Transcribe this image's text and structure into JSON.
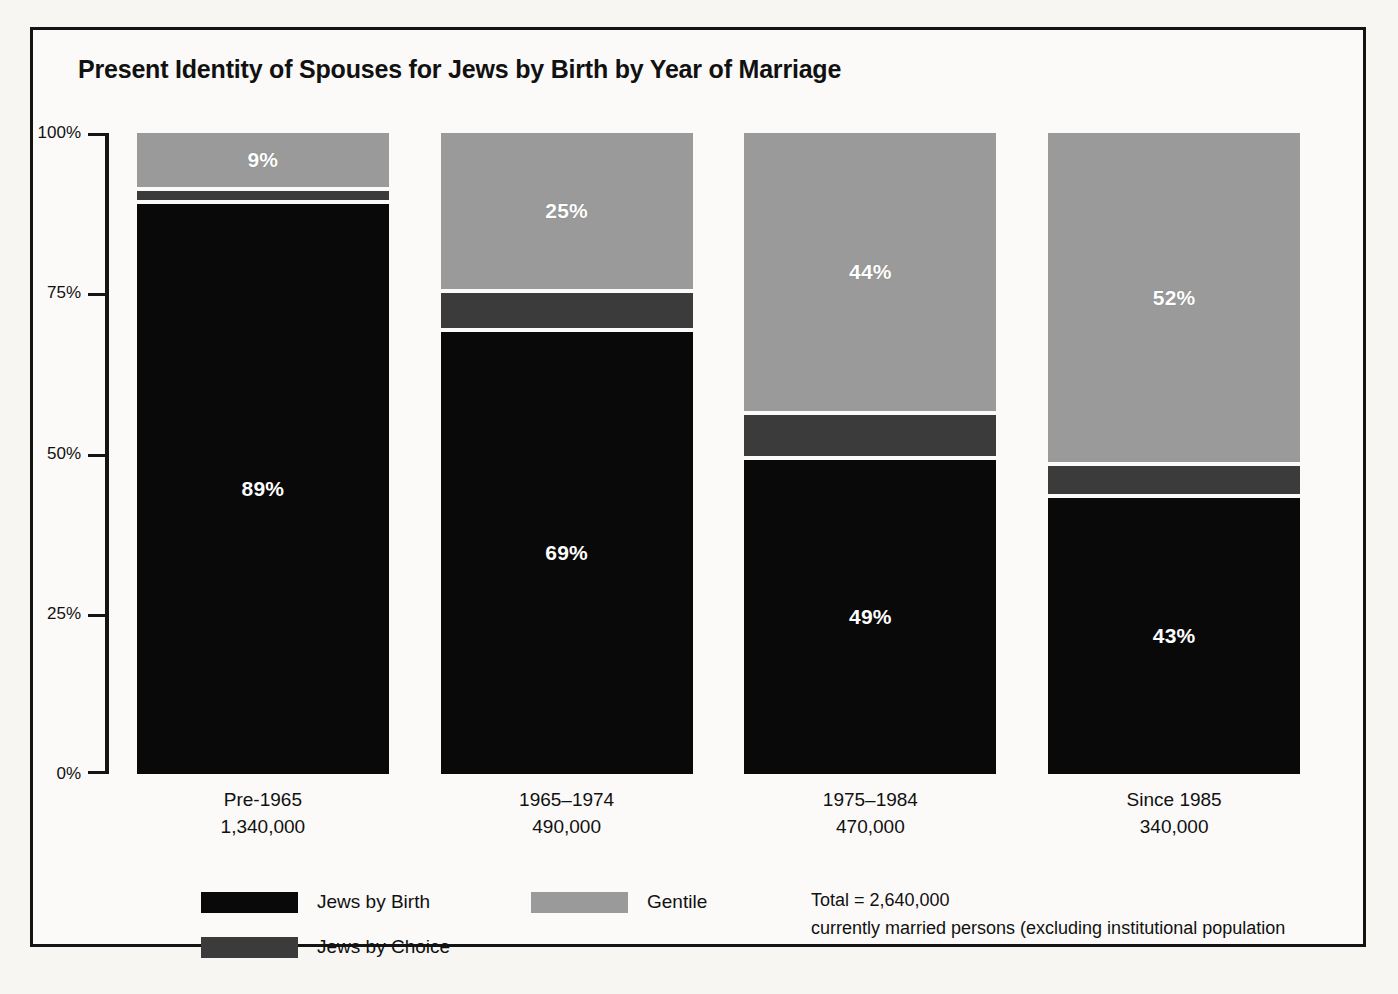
{
  "chart_data": {
    "type": "bar",
    "subtype": "stacked-100-percent",
    "title": "Present Identity of Spouses for Jews by Birth by Year of Marriage",
    "xlabel": "",
    "ylabel": "",
    "ylim": [
      0,
      100
    ],
    "grid": false,
    "legend_position": "bottom-left",
    "categories": [
      "Pre-1965",
      "1965–1974",
      "1975–1984",
      "Since 1985"
    ],
    "category_counts": [
      "1,340,000",
      "490,000",
      "470,000",
      "340,000"
    ],
    "y_ticks": [
      "0%",
      "25%",
      "50%",
      "75%",
      "100%"
    ],
    "y_tick_values": [
      0,
      25,
      50,
      75,
      100
    ],
    "series": [
      {
        "name": "Jews by Birth",
        "color": "#090909",
        "values": [
          89,
          69,
          49,
          43
        ],
        "labels": [
          "89%",
          "69%",
          "49%",
          "43%"
        ]
      },
      {
        "name": "Jews by Choice",
        "color": "#3b3b3b",
        "values": [
          2,
          6,
          7,
          5
        ],
        "labels": [
          "",
          "",
          "",
          ""
        ]
      },
      {
        "name": "Gentile",
        "color": "#9a9a9a",
        "values": [
          9,
          25,
          44,
          52
        ],
        "labels": [
          "9%",
          "25%",
          "44%",
          "52%"
        ]
      }
    ],
    "annotations": [
      "Total = 2,640,000",
      "currently married persons (excluding institutional population"
    ]
  },
  "title": "Present Identity of Spouses for Jews by Birth by Year of Marriage",
  "axis": {
    "y_ticks": [
      {
        "label": "100%",
        "value": 100
      },
      {
        "label": "75%",
        "value": 75
      },
      {
        "label": "50%",
        "value": 50
      },
      {
        "label": "25%",
        "value": 25
      },
      {
        "label": "0%",
        "value": 0
      }
    ]
  },
  "bars": [
    {
      "category": "Pre-1965",
      "count": "1,340,000",
      "segments": [
        {
          "series": "Gentile",
          "value": 9,
          "label": "9%"
        },
        {
          "series": "Jews by Choice",
          "value": 2,
          "label": ""
        },
        {
          "series": "Jews by Birth",
          "value": 89,
          "label": "89%"
        }
      ]
    },
    {
      "category": "1965–1974",
      "count": "490,000",
      "segments": [
        {
          "series": "Gentile",
          "value": 25,
          "label": "25%"
        },
        {
          "series": "Jews by Choice",
          "value": 6,
          "label": ""
        },
        {
          "series": "Jews by Birth",
          "value": 69,
          "label": "69%"
        }
      ]
    },
    {
      "category": "1975–1984",
      "count": "470,000",
      "segments": [
        {
          "series": "Gentile",
          "value": 44,
          "label": "44%"
        },
        {
          "series": "Jews by Choice",
          "value": 7,
          "label": ""
        },
        {
          "series": "Jews by Birth",
          "value": 49,
          "label": "49%"
        }
      ]
    },
    {
      "category": "Since 1985",
      "count": "340,000",
      "segments": [
        {
          "series": "Gentile",
          "value": 52,
          "label": "52%"
        },
        {
          "series": "Jews by Choice",
          "value": 5,
          "label": ""
        },
        {
          "series": "Jews by Birth",
          "value": 43,
          "label": "43%"
        }
      ]
    }
  ],
  "legend": [
    {
      "label": "Jews by Birth",
      "color": "#090909"
    },
    {
      "label": "Jews by Choice",
      "color": "#3b3b3b"
    },
    {
      "label": "Gentile",
      "color": "#9a9a9a"
    }
  ],
  "note": {
    "line1": "Total = 2,640,000",
    "line2": "currently married persons (excluding institutional population"
  },
  "colors": {
    "jews_by_birth": "#090909",
    "jews_by_choice": "#3b3b3b",
    "gentile": "#9a9a9a",
    "frame": "#141414",
    "background": "#fbfaf8"
  }
}
